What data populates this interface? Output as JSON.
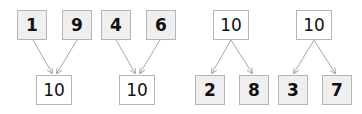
{
  "diagrams": [
    {
      "type": "combine",
      "parts": [
        "1",
        "9"
      ],
      "whole": "10"
    },
    {
      "type": "combine",
      "parts": [
        "4",
        "6"
      ],
      "whole": "10"
    },
    {
      "type": "split",
      "whole": "10",
      "parts": [
        "2",
        "8"
      ]
    },
    {
      "type": "split",
      "whole": "10",
      "parts": [
        "3",
        "7"
      ]
    }
  ],
  "colors": {
    "box_border": "#b5b5b5",
    "part_fill": "#efefef",
    "whole_fill": "#ffffff",
    "arrow": "#a8a8a8"
  }
}
